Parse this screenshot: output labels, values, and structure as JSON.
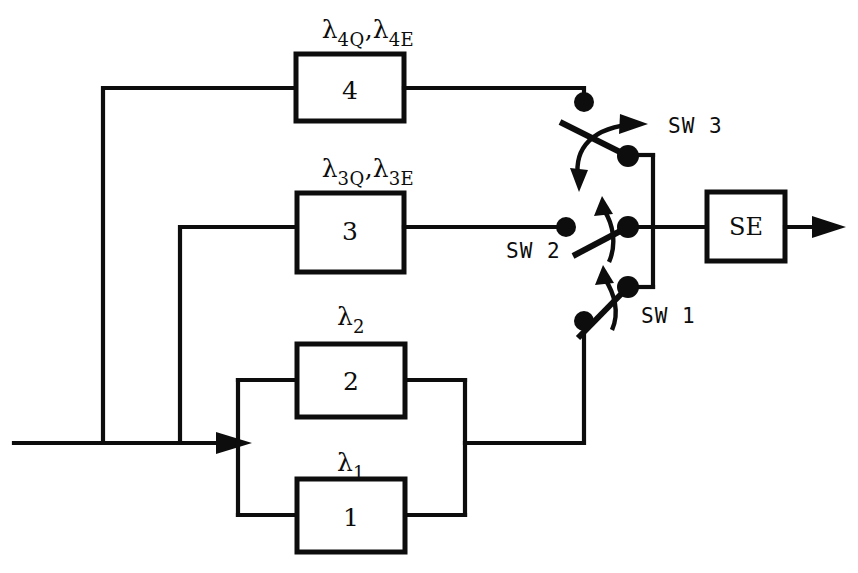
{
  "diagram": {
    "type": "reliability-block-diagram-with-switches",
    "blocks": [
      {
        "id": "block-1",
        "label": "1",
        "rate_label": "λ",
        "rate_subscripts": [
          "1"
        ]
      },
      {
        "id": "block-2",
        "label": "2",
        "rate_label": "λ",
        "rate_subscripts": [
          "2"
        ]
      },
      {
        "id": "block-3",
        "label": "3",
        "rate_label": "λ",
        "rate_subscripts": [
          "3Q",
          "3E"
        ]
      },
      {
        "id": "block-4",
        "label": "4",
        "rate_label": "λ",
        "rate_subscripts": [
          "4Q",
          "4E"
        ]
      },
      {
        "id": "block-se",
        "label": "SE"
      }
    ],
    "labels": {
      "lambda_4": {
        "symbol": "λ",
        "sub_a": "4Q",
        "sep": ",",
        "sub_b": "4E"
      },
      "lambda_3": {
        "symbol": "λ",
        "sub_a": "3Q",
        "sep": ",",
        "sub_b": "3E"
      },
      "lambda_2": {
        "symbol": "λ",
        "sub_a": "2"
      },
      "lambda_1": {
        "symbol": "λ",
        "sub_a": "1"
      },
      "box4": "4",
      "box3": "3",
      "box2": "2",
      "box1": "1",
      "se": "SE",
      "sw3": "SW  3",
      "sw2": "SW  2",
      "sw1": "SW  1"
    },
    "colors": {
      "line": "#0d0d0d",
      "background": "#ffffff"
    }
  }
}
